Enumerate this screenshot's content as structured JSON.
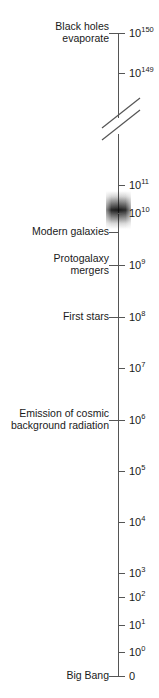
{
  "figure": {
    "type": "logarithmic-timeline",
    "orientation": "vertical",
    "axis_unit_note": "",
    "top_clipped_caption": "",
    "axis": {
      "top_y": 33,
      "bottom_y": 676,
      "x": 118,
      "line_color": "#555555",
      "has_break": true,
      "break_y": 120
    },
    "band": {
      "name": "modern-galaxy-epoch-band",
      "center_label": "10^10",
      "color": "#0a0a0a"
    }
  },
  "ticks": [
    {
      "base": "10",
      "exp": "150",
      "y": 33,
      "side": "right"
    },
    {
      "base": "10",
      "exp": "149",
      "y": 73,
      "side": "right"
    },
    {
      "base": "10",
      "exp": "11",
      "y": 185,
      "side": "right"
    },
    {
      "base": "10",
      "exp": "10",
      "y": 213,
      "side": "right"
    },
    {
      "base": "10",
      "exp": "9",
      "y": 265,
      "side": "right"
    },
    {
      "base": "10",
      "exp": "8",
      "y": 317,
      "side": "right"
    },
    {
      "base": "10",
      "exp": "7",
      "y": 368,
      "side": "right"
    },
    {
      "base": "10",
      "exp": "6",
      "y": 420,
      "side": "right"
    },
    {
      "base": "10",
      "exp": "5",
      "y": 471,
      "side": "right"
    },
    {
      "base": "10",
      "exp": "4",
      "y": 522,
      "side": "right"
    },
    {
      "base": "10",
      "exp": "3",
      "y": 573,
      "side": "right"
    },
    {
      "base": "10",
      "exp": "2",
      "y": 597,
      "side": "right"
    },
    {
      "base": "10",
      "exp": "1",
      "y": 625,
      "side": "right"
    },
    {
      "base": "10",
      "exp": "0",
      "y": 652,
      "side": "right"
    },
    {
      "base": "0",
      "exp": "",
      "y": 676,
      "side": "right"
    }
  ],
  "events": [
    {
      "name": "black-holes-evaporate",
      "lines": [
        "Black holes",
        "evaporate"
      ],
      "y": 33
    },
    {
      "name": "modern-galaxies",
      "lines": [
        "Modern galaxies"
      ],
      "y": 232
    },
    {
      "name": "protogalaxy-mergers",
      "lines": [
        "Protogalaxy",
        "mergers"
      ],
      "y": 265
    },
    {
      "name": "first-stars",
      "lines": [
        "First stars"
      ],
      "y": 317
    },
    {
      "name": "cmb-emission",
      "lines": [
        "Emission of cosmic",
        "background radiation"
      ],
      "y": 420
    },
    {
      "name": "big-bang",
      "lines": [
        "Big Bang"
      ],
      "y": 676
    }
  ]
}
